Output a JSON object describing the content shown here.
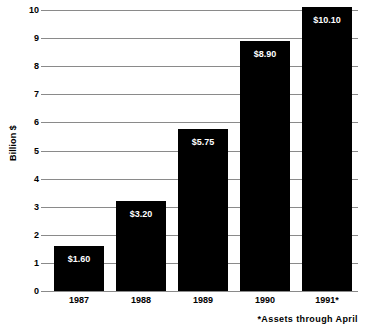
{
  "chart_data": {
    "type": "bar",
    "title": "",
    "xlabel": "",
    "ylabel": "Billion $",
    "categories": [
      "1987",
      "1988",
      "1989",
      "1990",
      "1991*"
    ],
    "values": [
      1.6,
      3.2,
      5.75,
      8.9,
      10.1
    ],
    "value_labels": [
      "$1.60",
      "$3.20",
      "$5.75",
      "$8.90",
      "$10.10"
    ],
    "ylim": [
      0,
      10
    ],
    "ytick_labels": [
      "0",
      "1",
      "2",
      "3",
      "4",
      "5",
      "6",
      "7",
      "8",
      "9",
      "10"
    ],
    "ytick_values": [
      0,
      1,
      2,
      3,
      4,
      5,
      6,
      7,
      8,
      9,
      10
    ],
    "grid": true,
    "legend": false,
    "bar_color": "#000000",
    "grid_color": "#8a8a8a",
    "value_label_color": "#ffffff",
    "background_color": "#ffffff",
    "annotations": [
      "*Assets through April"
    ]
  },
  "footnote": "*Assets through April"
}
